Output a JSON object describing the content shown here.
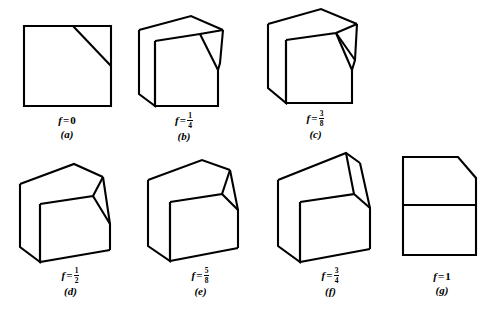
{
  "figure": {
    "background_color": "#ffffff",
    "stroke_color": "#000000",
    "variable_symbol": "f",
    "equals_symbol": "=",
    "panels": [
      {
        "id": "a",
        "letter_label": "(a)",
        "f_display": "0",
        "f_value": 0,
        "f_numerator": null,
        "f_denominator": null,
        "shape_name": "flat-square-with-diagonal",
        "description": "Square outline with a diagonal cut line from top edge to right edge"
      },
      {
        "id": "b",
        "letter_label": "(b)",
        "f_display": "1/4",
        "f_value": 0.25,
        "f_numerator": "1",
        "f_denominator": "4",
        "shape_name": "shallow-block-with-sloped-corner",
        "description": "Low rectangular block with sloped cut corner on the right"
      },
      {
        "id": "c",
        "letter_label": "(c)",
        "f_display": "3/8",
        "f_value": 0.375,
        "f_numerator": "3",
        "f_denominator": "8",
        "shape_name": "block-with-sloped-corner",
        "description": "Block with a tilted top face and a triangular cut wedge at the right"
      },
      {
        "id": "d",
        "letter_label": "(d)",
        "f_display": "1/2",
        "f_value": 0.5,
        "f_numerator": "1",
        "f_denominator": "2",
        "shape_name": "cube-with-corner-wedge",
        "description": "Cube with a sloping roof face and a triangular wedge on the right side"
      },
      {
        "id": "e",
        "letter_label": "(e)",
        "f_display": "5/8",
        "f_value": 0.625,
        "f_numerator": "5",
        "f_denominator": "8",
        "shape_name": "cube-with-taller-corner-wedge",
        "description": "Cube with a steeper sloping roof and larger triangular wedge on the right"
      },
      {
        "id": "f",
        "letter_label": "(f)",
        "f_display": "3/4",
        "f_value": 0.75,
        "f_numerator": "3",
        "f_denominator": "4",
        "shape_name": "cube-with-peaked-ridge",
        "description": "Cube with a high peaked ridge and narrow steep wedge on the right"
      },
      {
        "id": "g",
        "letter_label": "(g)",
        "f_display": "1",
        "f_value": 1,
        "f_numerator": null,
        "f_denominator": null,
        "shape_name": "flat-rectangle-chamfered",
        "description": "Rectangle with chamfered top-right corner and a horizontal divider line"
      }
    ]
  }
}
